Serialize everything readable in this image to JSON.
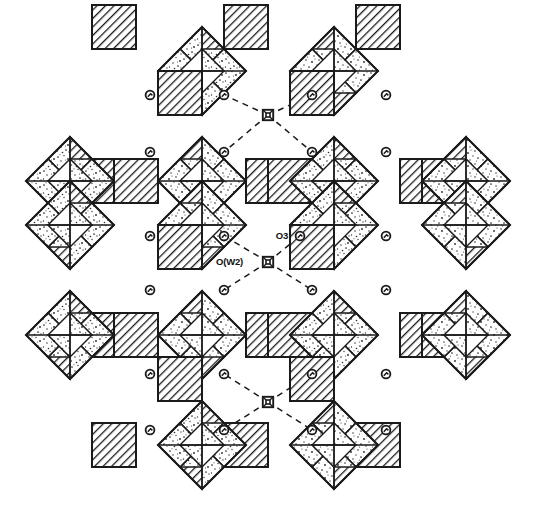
{
  "figure": {
    "domain": "crystal-structure-diagram",
    "background_color": "#ffffff",
    "line_color": "#1a1a1a",
    "width": 536,
    "height": 511
  },
  "labels": [
    {
      "id": "ow2",
      "text": "O(W2)",
      "x": 243,
      "y": 265,
      "anchor": "end"
    },
    {
      "id": "o3",
      "text": "O3",
      "x": 288,
      "y": 239,
      "anchor": "end"
    }
  ],
  "legend_keys": {
    "stippled_polyhedron": "octahedron (stippled)",
    "hatched_polyhedron": "polyhedron (diagonal hatch)",
    "circle_atom": "oxygen atom",
    "square_atom": "water oxygen O(W2)",
    "dashed_line": "hydrogen bond"
  },
  "geometry": {
    "cell": 44,
    "origin_x": 92,
    "origin_y": 27,
    "octahedron_centers": [
      [
        202,
        71
      ],
      [
        334,
        71
      ],
      [
        70,
        181
      ],
      [
        202,
        181
      ],
      [
        334,
        181
      ],
      [
        466,
        181
      ],
      [
        70,
        225
      ],
      [
        202,
        225
      ],
      [
        334,
        225
      ],
      [
        466,
        225
      ],
      [
        70,
        335
      ],
      [
        202,
        335
      ],
      [
        334,
        335
      ],
      [
        466,
        335
      ],
      [
        202,
        445
      ],
      [
        334,
        445
      ]
    ],
    "hatched_squares": [
      [
        114,
        27
      ],
      [
        246,
        27
      ],
      [
        378,
        27
      ],
      [
        114,
        445
      ],
      [
        246,
        445
      ],
      [
        378,
        445
      ]
    ],
    "hatched_bridges_h": [
      [
        92,
        181
      ],
      [
        114,
        181
      ],
      [
        246,
        181
      ],
      [
        268,
        181
      ],
      [
        400,
        181
      ],
      [
        422,
        181
      ],
      [
        92,
        335
      ],
      [
        114,
        335
      ],
      [
        246,
        335
      ],
      [
        268,
        335
      ],
      [
        400,
        335
      ],
      [
        422,
        335
      ]
    ],
    "hatched_bridges_v": [
      [
        180,
        93
      ],
      [
        312,
        93
      ],
      [
        180,
        247
      ],
      [
        312,
        247
      ],
      [
        180,
        379
      ],
      [
        312,
        379
      ]
    ]
  },
  "water_sites": [
    {
      "id": "w-top",
      "x": 268,
      "y": 115
    },
    {
      "id": "w-middle",
      "x": 268,
      "y": 262
    },
    {
      "id": "w-bottom",
      "x": 268,
      "y": 402
    }
  ],
  "oxygen_atoms": [
    {
      "x": 150,
      "y": 95
    },
    {
      "x": 224,
      "y": 95
    },
    {
      "x": 312,
      "y": 95
    },
    {
      "x": 386,
      "y": 95
    },
    {
      "x": 150,
      "y": 152
    },
    {
      "x": 224,
      "y": 152
    },
    {
      "x": 312,
      "y": 152
    },
    {
      "x": 386,
      "y": 152
    },
    {
      "x": 150,
      "y": 236
    },
    {
      "x": 224,
      "y": 236
    },
    {
      "x": 300,
      "y": 236
    },
    {
      "x": 386,
      "y": 236
    },
    {
      "x": 150,
      "y": 290
    },
    {
      "x": 224,
      "y": 290
    },
    {
      "x": 312,
      "y": 290
    },
    {
      "x": 386,
      "y": 290
    },
    {
      "x": 150,
      "y": 374
    },
    {
      "x": 224,
      "y": 374
    },
    {
      "x": 312,
      "y": 374
    },
    {
      "x": 386,
      "y": 374
    },
    {
      "x": 150,
      "y": 430
    },
    {
      "x": 224,
      "y": 430
    },
    {
      "x": 312,
      "y": 430
    },
    {
      "x": 386,
      "y": 430
    }
  ],
  "hydrogen_bonds": [
    {
      "from": "w-top",
      "to": [
        224,
        95
      ]
    },
    {
      "from": "w-top",
      "to": [
        312,
        95
      ]
    },
    {
      "from": "w-top",
      "to": [
        224,
        152
      ]
    },
    {
      "from": "w-top",
      "to": [
        312,
        152
      ]
    },
    {
      "from": "w-middle",
      "to": [
        224,
        236
      ]
    },
    {
      "from": "w-middle",
      "to": [
        300,
        236
      ]
    },
    {
      "from": "w-middle",
      "to": [
        224,
        290
      ]
    },
    {
      "from": "w-middle",
      "to": [
        312,
        290
      ]
    },
    {
      "from": "w-bottom",
      "to": [
        224,
        374
      ]
    },
    {
      "from": "w-bottom",
      "to": [
        312,
        374
      ]
    },
    {
      "from": "w-bottom",
      "to": [
        224,
        430
      ]
    },
    {
      "from": "w-bottom",
      "to": [
        312,
        430
      ]
    }
  ]
}
